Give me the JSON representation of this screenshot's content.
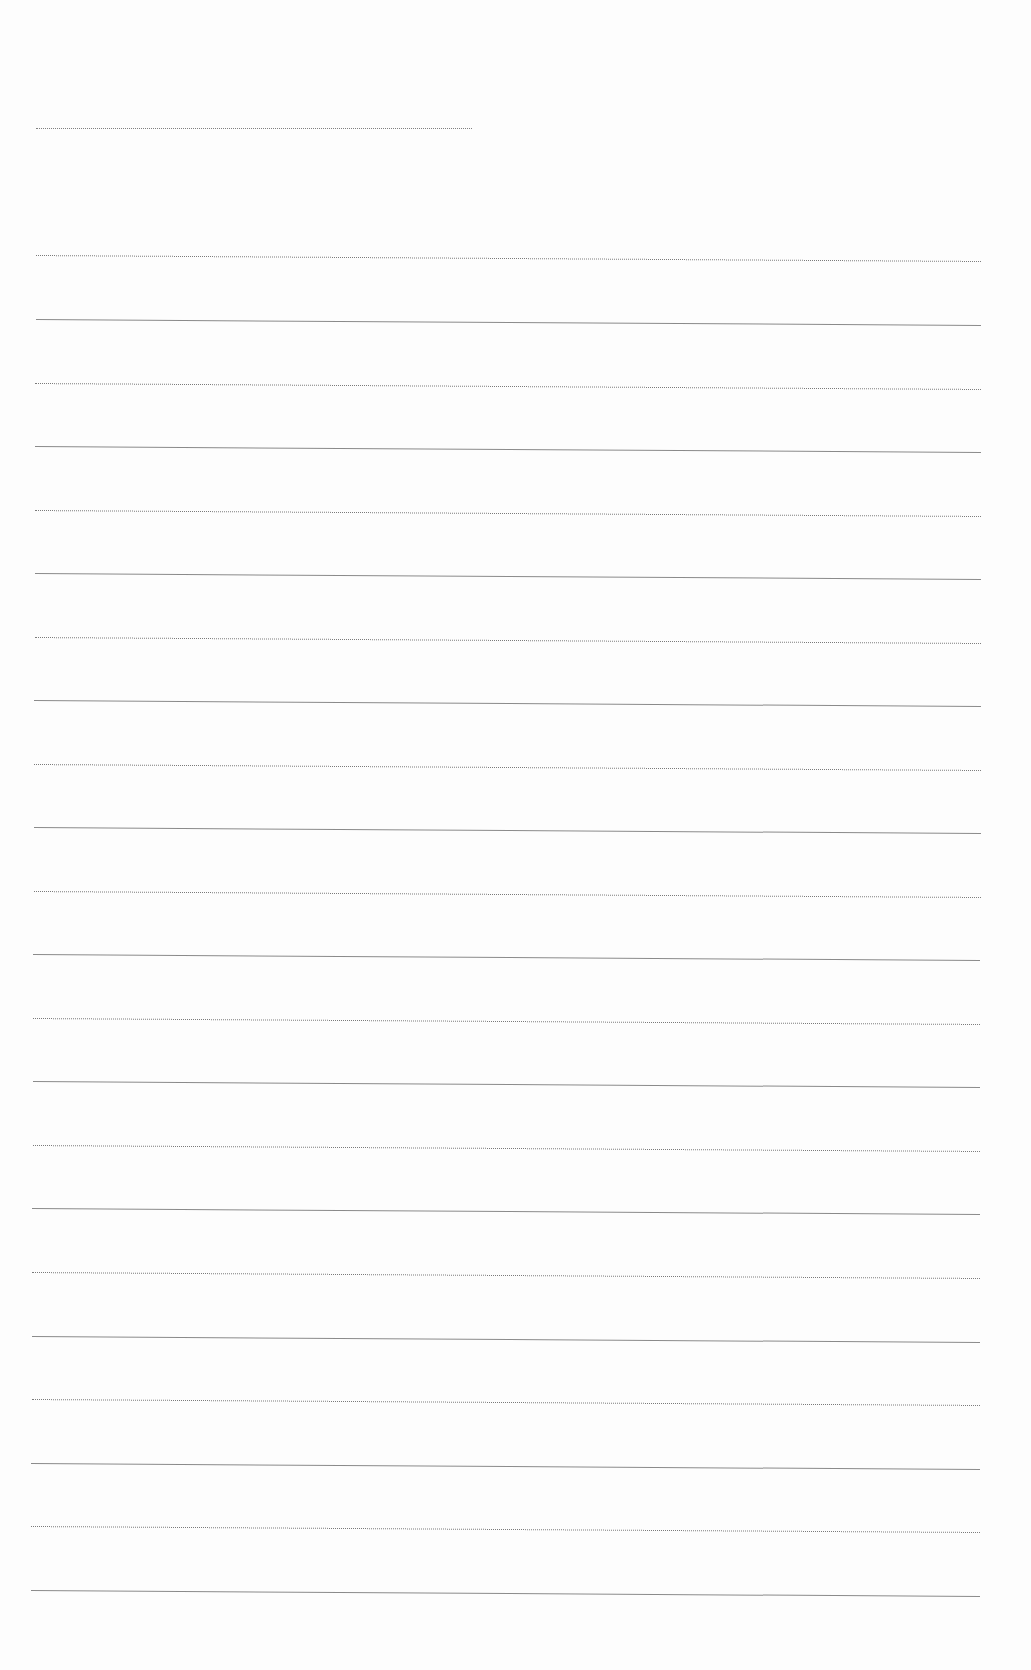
{
  "document": {
    "type": "blank ruled sheet",
    "line_color": "#8a8a8a",
    "background_color": "#fdfdfd",
    "header_line": {
      "x1": 36,
      "x2": 472,
      "y": 128
    },
    "lines": [
      {
        "x1": 36,
        "x2": 981,
        "y": 255,
        "slope": 6,
        "style": "dotted"
      },
      {
        "x1": 36,
        "x2": 981,
        "y": 319,
        "slope": 6,
        "style": "solid"
      },
      {
        "x1": 35,
        "x2": 981,
        "y": 383,
        "slope": 6,
        "style": "dotted"
      },
      {
        "x1": 35,
        "x2": 981,
        "y": 446,
        "slope": 6,
        "style": "solid"
      },
      {
        "x1": 35,
        "x2": 981,
        "y": 510,
        "slope": 6,
        "style": "dotted"
      },
      {
        "x1": 35,
        "x2": 981,
        "y": 573,
        "slope": 6,
        "style": "solid"
      },
      {
        "x1": 35,
        "x2": 981,
        "y": 637,
        "slope": 6,
        "style": "dotted"
      },
      {
        "x1": 34,
        "x2": 981,
        "y": 700,
        "slope": 6,
        "style": "solid"
      },
      {
        "x1": 34,
        "x2": 981,
        "y": 764,
        "slope": 6,
        "style": "dotted"
      },
      {
        "x1": 34,
        "x2": 981,
        "y": 827,
        "slope": 6,
        "style": "solid"
      },
      {
        "x1": 34,
        "x2": 981,
        "y": 891,
        "slope": 6,
        "style": "dotted"
      },
      {
        "x1": 33,
        "x2": 980,
        "y": 954,
        "slope": 6,
        "style": "solid"
      },
      {
        "x1": 33,
        "x2": 980,
        "y": 1018,
        "slope": 6,
        "style": "dotted"
      },
      {
        "x1": 33,
        "x2": 980,
        "y": 1081,
        "slope": 6,
        "style": "solid"
      },
      {
        "x1": 33,
        "x2": 980,
        "y": 1145,
        "slope": 6,
        "style": "dotted"
      },
      {
        "x1": 32,
        "x2": 980,
        "y": 1208,
        "slope": 6,
        "style": "solid"
      },
      {
        "x1": 32,
        "x2": 980,
        "y": 1272,
        "slope": 6,
        "style": "dotted"
      },
      {
        "x1": 32,
        "x2": 980,
        "y": 1336,
        "slope": 6,
        "style": "solid"
      },
      {
        "x1": 32,
        "x2": 980,
        "y": 1399,
        "slope": 6,
        "style": "dotted"
      },
      {
        "x1": 31,
        "x2": 980,
        "y": 1463,
        "slope": 6,
        "style": "solid"
      },
      {
        "x1": 31,
        "x2": 980,
        "y": 1526,
        "slope": 6,
        "style": "dotted"
      },
      {
        "x1": 31,
        "x2": 980,
        "y": 1590,
        "slope": 6,
        "style": "solid"
      }
    ]
  }
}
